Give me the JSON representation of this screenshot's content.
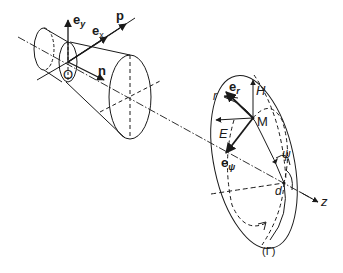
{
  "diagram": {
    "type": "physics-geometry",
    "colors": {
      "stroke": "#1a1a1a",
      "background": "#ffffff"
    },
    "labels": {
      "e_y_main": "e",
      "e_y_sub": "y",
      "e_x_main": "e",
      "e_x_sub": "x",
      "p": "p",
      "n": "n",
      "origin": "O",
      "r": "r",
      "e_r_main": "e",
      "e_r_sub": "r",
      "H": "H",
      "M": "M",
      "E": "E",
      "e_psi_main": "e",
      "e_psi_sub": "ψ",
      "psi": "ψ",
      "d": "d",
      "z": "z",
      "surface": "(Γ)"
    },
    "nodes": [
      {
        "id": "O",
        "label": "O",
        "x": 68,
        "y": 62
      },
      {
        "id": "M",
        "label": "M",
        "x": 253,
        "y": 118
      },
      {
        "id": "d",
        "label": "d",
        "x": 284,
        "y": 183
      }
    ],
    "vectors": [
      {
        "from": "O",
        "label": "e_y",
        "direction": "up"
      },
      {
        "from": "O",
        "label": "e_x",
        "direction": "along p"
      },
      {
        "from": "O",
        "label": "p",
        "direction": "propagation"
      },
      {
        "from": "O",
        "label": "n",
        "direction": "normal"
      },
      {
        "from": "M",
        "label": "H",
        "direction": "up"
      },
      {
        "from": "M",
        "label": "E",
        "direction": "left"
      },
      {
        "from": "M",
        "label": "e_r",
        "direction": "upper-left"
      },
      {
        "from": "M",
        "label": "e_ψ",
        "direction": "lower-left"
      },
      {
        "from": "d",
        "label": "z",
        "direction": "axis"
      }
    ]
  }
}
